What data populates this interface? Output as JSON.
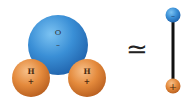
{
  "diagram": {
    "molecule": {
      "oxygen": {
        "symbol": "O",
        "charge": "–",
        "color": "#3a8fd6"
      },
      "hydrogen_left": {
        "symbol": "H",
        "charge": "+",
        "color": "#e0843a"
      },
      "hydrogen_right": {
        "symbol": "H",
        "charge": "+",
        "color": "#e0843a"
      }
    },
    "relation_symbol": "≃",
    "dipole": {
      "negative_end": {
        "charge": "–",
        "color": "#3a8fd6"
      },
      "positive_end": {
        "charge": "+",
        "color": "#e0843a"
      },
      "rod_color": "#111111"
    }
  }
}
